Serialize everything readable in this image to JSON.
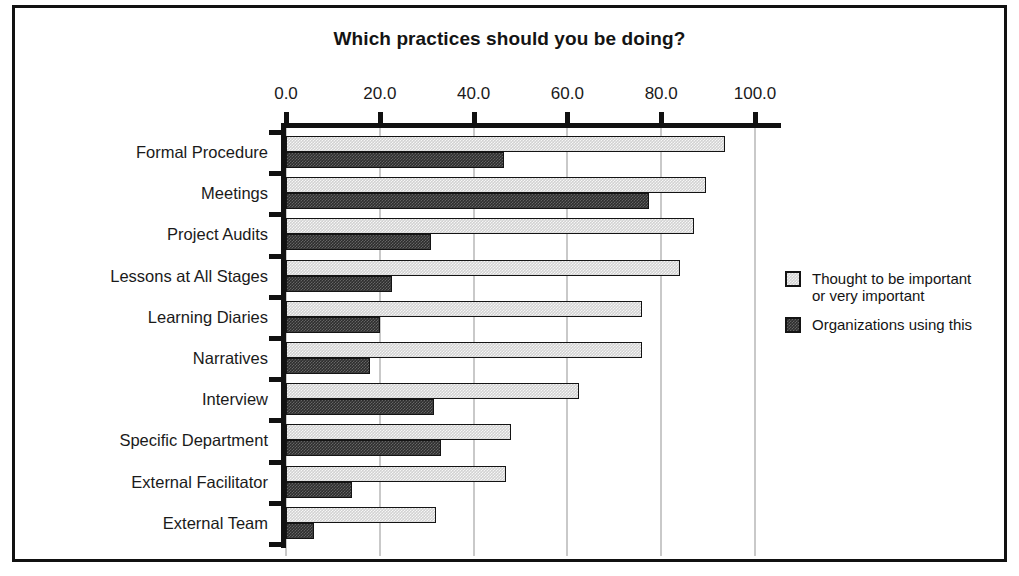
{
  "chart_data": {
    "type": "bar",
    "orientation": "horizontal",
    "title": "Which practices should you be doing?",
    "xlabel": "",
    "ylabel": "",
    "xlim": [
      0,
      100
    ],
    "xticks": [
      "0.0",
      "20.0",
      "40.0",
      "60.0",
      "80.0",
      "100.0"
    ],
    "xtick_values": [
      0,
      20,
      40,
      60,
      80,
      100
    ],
    "grid": true,
    "grid_axis": "x",
    "axis_position": "top",
    "legend_position": "right",
    "categories": [
      "Formal Procedure",
      "Meetings",
      "Project Audits",
      "Lessons at All Stages",
      "Learning Diaries",
      "Narratives",
      "Interview",
      "Specific Department",
      "External Facilitator",
      "External Team"
    ],
    "series": [
      {
        "name": "Thought to be important\nor very important",
        "color": "#d2d2d2",
        "values": [
          93.5,
          89.5,
          87.0,
          84.0,
          76.0,
          76.0,
          62.5,
          48.0,
          47.0,
          32.0
        ]
      },
      {
        "name": "Organizations using this",
        "color": "#2e2e2e",
        "values": [
          46.5,
          77.5,
          31.0,
          22.5,
          20.0,
          18.0,
          31.5,
          33.0,
          14.0,
          6.0
        ]
      }
    ]
  },
  "legend": {
    "items": [
      {
        "label": "Thought to be important\nor very important",
        "swatch": "light"
      },
      {
        "label": "Organizations using this",
        "swatch": "dark"
      }
    ]
  },
  "colors": {
    "frame_border": "#111111",
    "axis": "#111111",
    "gridline": "#c9c9c9",
    "text": "#1a1a1a",
    "background": "#ffffff",
    "series_light": "#d2d2d2",
    "series_dark": "#2e2e2e"
  }
}
